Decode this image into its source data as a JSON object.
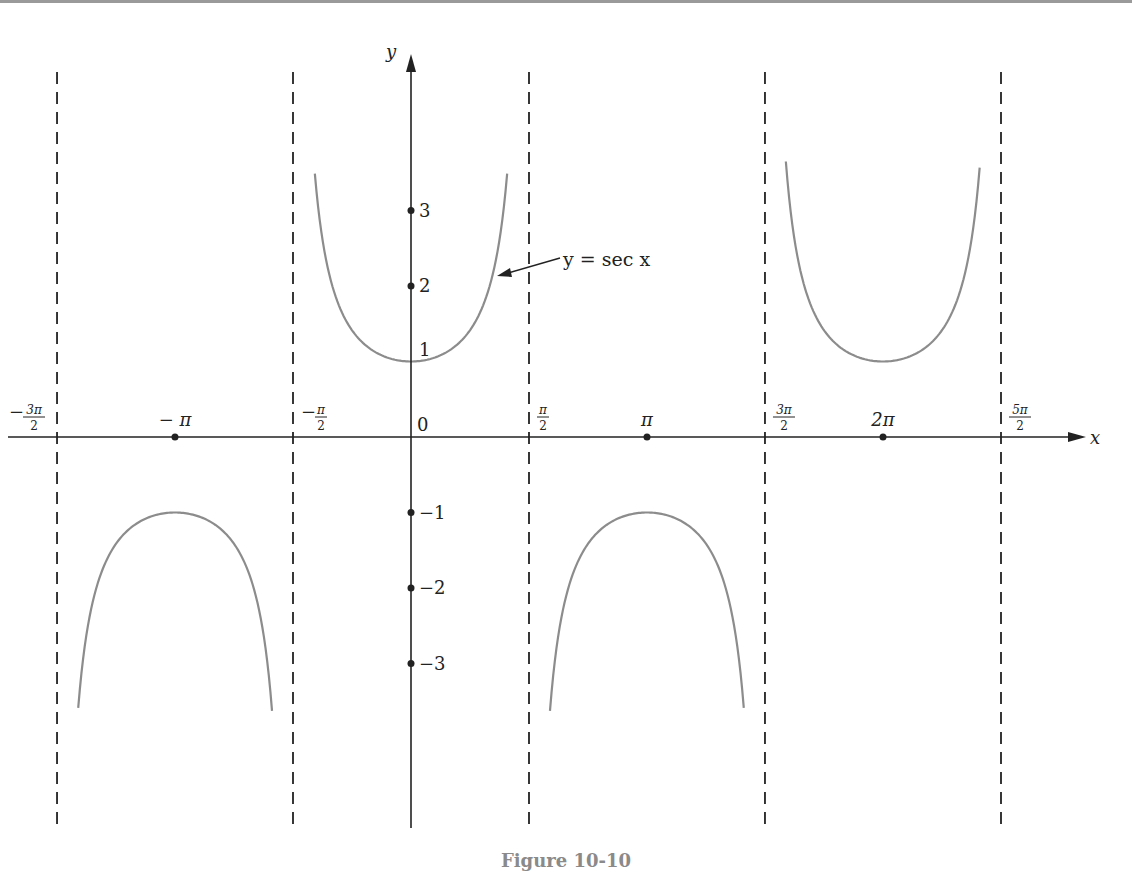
{
  "figure": {
    "caption": "Figure 10-10",
    "curve_label": "y = sec x",
    "colors": {
      "axis": "#222222",
      "curve": "#8c8c8c",
      "caption": "#8a8a8a",
      "top_rule": "#9a9a9a"
    }
  },
  "axes": {
    "x_name": "x",
    "y_name": "y",
    "origin_label": "0",
    "x_ticks": [
      {
        "label": "-3π/2",
        "value": -4.712,
        "num": "3π",
        "den": "2",
        "neg": true,
        "type": "asymptote"
      },
      {
        "label": "-π",
        "value": -3.1416,
        "type": "point"
      },
      {
        "label": "-π/2",
        "value": -1.5708,
        "num": "π",
        "den": "2",
        "neg": true,
        "type": "asymptote"
      },
      {
        "label": "π/2",
        "value": 1.5708,
        "num": "π",
        "den": "2",
        "neg": false,
        "type": "asymptote"
      },
      {
        "label": "π",
        "value": 3.1416,
        "type": "point"
      },
      {
        "label": "3π/2",
        "value": 4.712,
        "num": "3π",
        "den": "2",
        "neg": false,
        "type": "asymptote"
      },
      {
        "label": "2π",
        "value": 6.2832,
        "type": "point"
      },
      {
        "label": "5π/2",
        "value": 7.854,
        "num": "5π",
        "den": "2",
        "neg": false,
        "type": "asymptote"
      }
    ],
    "y_ticks": [
      {
        "label": "3",
        "value": 3
      },
      {
        "label": "2",
        "value": 2
      },
      {
        "label": "1",
        "value": 1
      },
      {
        "label": "−1",
        "value": -1
      },
      {
        "label": "−2",
        "value": -2
      },
      {
        "label": "−3",
        "value": -3
      }
    ]
  },
  "chart_data": {
    "type": "line",
    "title": "Figure 10-10",
    "xlabel": "x",
    "ylabel": "y",
    "xlim": [
      -5.0,
      8.8
    ],
    "ylim": [
      -5.1,
      5.3
    ],
    "grid": false,
    "legend": null,
    "annotations": [
      {
        "text": "y = sec x",
        "arrow_to": {
          "x": 1.1,
          "y": 2.02
        }
      }
    ],
    "asymptotes_x": [
      -4.712,
      -1.5708,
      1.5708,
      4.712,
      7.854
    ],
    "series": [
      {
        "name": "y = sec x (branch on (-3π/2, -π/2))",
        "x_range": [
          -4.43,
          -1.85
        ],
        "vertex": {
          "x": -3.1416,
          "y": -1
        },
        "y_cutoff": -3.4
      },
      {
        "name": "y = sec x (branch on (-π/2, π/2))",
        "x_range": [
          -1.28,
          1.28
        ],
        "vertex": {
          "x": 0,
          "y": 1
        },
        "y_cutoff": 3.4
      },
      {
        "name": "y = sec x (branch on (π/2, 3π/2))",
        "x_range": [
          1.85,
          4.43
        ],
        "vertex": {
          "x": 3.1416,
          "y": -1
        },
        "y_cutoff": -3.4
      },
      {
        "name": "y = sec x (branch on (3π/2, 5π/2))",
        "x_range": [
          4.99,
          7.57
        ],
        "vertex": {
          "x": 6.2832,
          "y": 1
        },
        "y_cutoff": 3.4
      }
    ],
    "marked_points": [
      {
        "x": -3.1416,
        "y": 0
      },
      {
        "x": 3.1416,
        "y": 0
      },
      {
        "x": 6.2832,
        "y": 0
      },
      {
        "x": 0,
        "y": 3
      },
      {
        "x": 0,
        "y": 2
      },
      {
        "x": 0,
        "y": -1
      },
      {
        "x": 0,
        "y": -2
      },
      {
        "x": 0,
        "y": -3
      }
    ]
  }
}
